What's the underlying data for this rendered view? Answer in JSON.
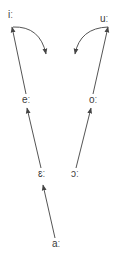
{
  "diagram": {
    "nodes": [
      {
        "id": "i",
        "label": "iː",
        "x": 8,
        "y": 11
      },
      {
        "id": "u",
        "label": "uː",
        "x": 100,
        "y": 15
      },
      {
        "id": "e",
        "label": "eː",
        "x": 22,
        "y": 96
      },
      {
        "id": "o",
        "label": "oː",
        "x": 89,
        "y": 96
      },
      {
        "id": "epsilon",
        "label": "ɛː",
        "x": 38,
        "y": 170
      },
      {
        "id": "openo",
        "label": "ɔː",
        "x": 71,
        "y": 170
      },
      {
        "id": "a",
        "label": "aː",
        "x": 52,
        "y": 240
      }
    ],
    "edges": [
      {
        "from": "aː",
        "to": "ɛː",
        "type": "straight"
      },
      {
        "from": "ɛː",
        "to": "eː",
        "type": "straight"
      },
      {
        "from": "eː",
        "to": "iː",
        "type": "straight"
      },
      {
        "from": "ɔː",
        "to": "oː",
        "type": "straight"
      },
      {
        "from": "oː",
        "to": "uː",
        "type": "straight"
      },
      {
        "from": "iː",
        "to": "diphthong",
        "type": "curved"
      },
      {
        "from": "uː",
        "to": "diphthong",
        "type": "curved"
      }
    ],
    "colors": {
      "line": "#555555",
      "text": "#3a3a3a",
      "background": "#ffffff"
    }
  }
}
